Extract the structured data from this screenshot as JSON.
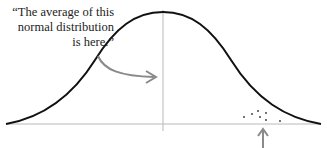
{
  "annotation": {
    "line1": "“The average of this",
    "line2": "normal distribution",
    "line3": "is here.”"
  },
  "diagram": {
    "type": "normal-distribution",
    "curve_color": "#111111",
    "axis_color": "#b0b0b0",
    "arrow_color": "#8a8a8a",
    "dot_color": "#333333"
  }
}
